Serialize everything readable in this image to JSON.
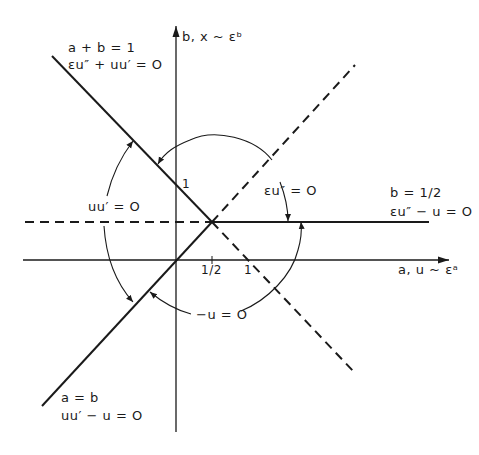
{
  "diagram": {
    "type": "matching-regions",
    "axes": {
      "horizontal": {
        "label": "a, u ~ εᵃ"
      },
      "vertical": {
        "label": "b, x ~ εᵇ"
      }
    },
    "ticks": {
      "a_half": "1/2",
      "a_one": "1",
      "b_one": "1"
    },
    "lines": [
      {
        "id": "a-plus-b-eq-1",
        "style": "solid",
        "label": "a + b = 1",
        "equation": "εu″ + uu′ = O"
      },
      {
        "id": "b-eq-half",
        "style": "solid",
        "label": "b = 1/2",
        "equation": "εu″ − u = O"
      },
      {
        "id": "a-eq-b",
        "style": "solid",
        "label": "a = b",
        "equation": "uu′ − u = O"
      },
      {
        "id": "dashed-diagonal-up",
        "style": "dashed"
      },
      {
        "id": "dashed-diagonal-down",
        "style": "dashed"
      },
      {
        "id": "dashed-horizontal",
        "style": "dashed"
      }
    ],
    "regions": [
      {
        "id": "upper-region",
        "equation": "εu″ = O"
      },
      {
        "id": "left-region",
        "equation": "uu′ = O"
      },
      {
        "id": "lower-region",
        "equation": "−u = O"
      }
    ]
  }
}
